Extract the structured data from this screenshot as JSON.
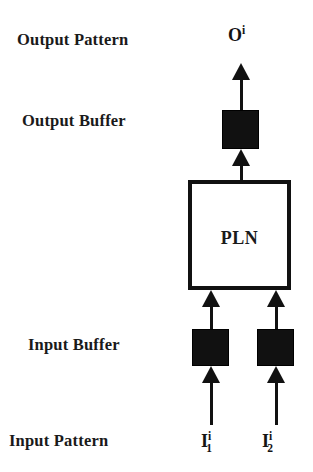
{
  "diagram": {
    "colors": {
      "background": "#ffffff",
      "ink": "#111111",
      "text": "#1a1a1a"
    },
    "labels": {
      "output_pattern": "Output Pattern",
      "output_buffer": "Output Buffer",
      "input_buffer": "Input Buffer",
      "input_pattern": "Input Pattern"
    },
    "nodes": {
      "pln": "PLN"
    },
    "signals": {
      "output": {
        "base": "O",
        "superscript": "i",
        "subscript": ""
      },
      "input_1": {
        "base": "I",
        "superscript": "i",
        "subscript": "1"
      },
      "input_2": {
        "base": "I",
        "superscript": "i",
        "subscript": "2"
      }
    },
    "blocks": [
      {
        "name": "output-buffer-block",
        "fill": "#111111"
      },
      {
        "name": "input-buffer-block-1",
        "fill": "#111111"
      },
      {
        "name": "input-buffer-block-2",
        "fill": "#111111"
      }
    ],
    "arrows": [
      {
        "name": "arrow-input1-to-buf",
        "direction": "up"
      },
      {
        "name": "arrow-input2-to-buf",
        "direction": "up"
      },
      {
        "name": "arrow-inbuf1-to-pln",
        "direction": "up"
      },
      {
        "name": "arrow-inbuf2-to-pln",
        "direction": "up"
      },
      {
        "name": "arrow-pln-to-output",
        "direction": "up"
      },
      {
        "name": "arrow-output-signal",
        "direction": "up"
      }
    ]
  }
}
